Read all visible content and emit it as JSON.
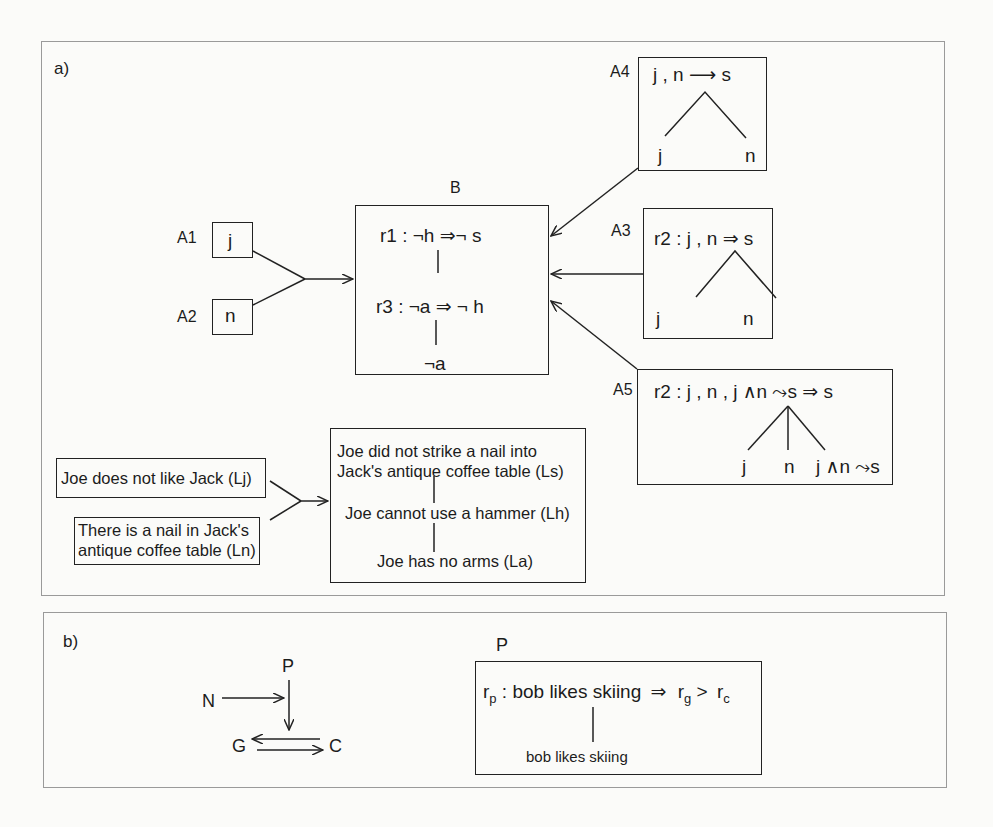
{
  "panel_a": {
    "label": "a)",
    "top": {
      "A1": {
        "name": "A1",
        "content": "j"
      },
      "A2": {
        "name": "A2",
        "content": "n"
      },
      "B": {
        "name": "B",
        "rule1": "r1 : ¬h  ⇒¬ s",
        "rule3": "r3 : ¬a  ⇒  ¬ h",
        "leaf": "¬a"
      },
      "A4": {
        "name": "A4",
        "conclusion": "j ,  n ⟶  s",
        "leaf_left": "j",
        "leaf_right": "n"
      },
      "A3": {
        "name": "A3",
        "conclusion": "r2 : j ,  n ⇒ s",
        "leaf_left": "j",
        "leaf_right": "n"
      },
      "A5": {
        "name": "A5",
        "conclusion": "r2 : j , n , j ∧n ⤳s  ⇒ s",
        "leaf_1": "j",
        "leaf_2": "n",
        "leaf_3": "j ∧n ⤳s"
      }
    },
    "bottom": {
      "premise_1": "Joe does not like Jack (Lj)",
      "premise_2_line1": "There is a nail in Jack's",
      "premise_2_line2": "antique coffee table (Ln)",
      "target_line1": "Joe did not strike a nail into",
      "target_line2": "Jack's antique coffee table (Ls)",
      "target_mid": "Joe cannot use a hammer (Lh)",
      "target_leaf": "Joe has no arms (La)"
    }
  },
  "panel_b": {
    "label": "b)",
    "graph": {
      "P": "P",
      "N": "N",
      "G": "G",
      "C": "C"
    },
    "box": {
      "name": "P",
      "r_main": "r",
      "r_main_sub": "p",
      "premise": ": bob likes skiing",
      "arrow": "⇒",
      "r_g": "r",
      "r_g_sub": "g",
      "gt": ">",
      "r_c": "r",
      "r_c_sub": "c",
      "leaf": "bob likes skiing"
    }
  }
}
